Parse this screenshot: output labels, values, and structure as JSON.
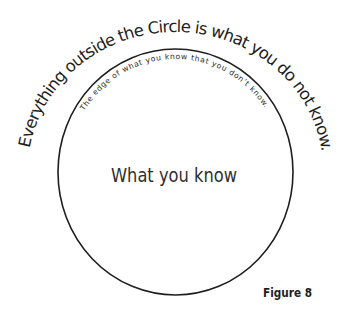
{
  "diagram": {
    "outer_caption": "Everything outside the Circle is what you do not know.",
    "edge_caption": "The edge of what you know that you don’t know.",
    "center_label": "What you know",
    "figure_label": "Figure 8"
  },
  "colors": {
    "background": "#ffffff",
    "circle_stroke": "#1e1e1e",
    "text": "#1e1e1e"
  }
}
